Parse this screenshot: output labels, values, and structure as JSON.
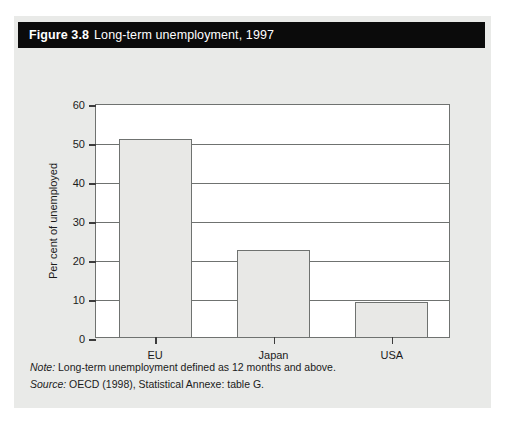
{
  "figure": {
    "number": "Figure 3.8",
    "title": "Long-term unemployment, 1997"
  },
  "footnotes": {
    "note_lead": "Note:",
    "note_text": "Long-term unemployment defined as 12 months and above.",
    "source_lead": "Source:",
    "source_text": "OECD (1998), Statistical Annexe: table G."
  },
  "chart_data": {
    "type": "bar",
    "title": "Long-term unemployment, 1997",
    "categories": [
      "EU",
      "Japan",
      "USA"
    ],
    "values": [
      50.8,
      22.4,
      9.0
    ],
    "xlabel": "",
    "ylabel": "Per cent of unemployed",
    "ylim": [
      0,
      60
    ],
    "yticks": [
      0,
      10,
      20,
      30,
      40,
      50,
      60
    ],
    "ytick_labels": [
      "0",
      "10",
      "20",
      "30",
      "40",
      "50",
      "60"
    ],
    "grid": true,
    "grid_axis": "y",
    "legend": null,
    "bar_fill": "#e8e8e6",
    "bar_edge": "#6f7270"
  }
}
